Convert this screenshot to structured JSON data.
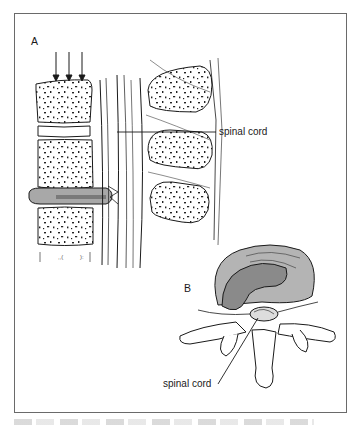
{
  "figure": {
    "panel_a": {
      "letter": "A",
      "callout": "spinal cord"
    },
    "panel_b": {
      "letter": "B",
      "callout": "spinal cord"
    },
    "colors": {
      "ink": "#1a1a1a",
      "disc_fill": "#a8a8a8",
      "disc_inner": "#8a8a8a",
      "frame": "#6a6a6a"
    }
  }
}
